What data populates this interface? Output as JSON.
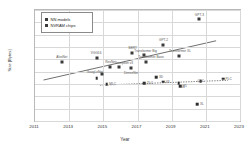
{
  "chart_data": {
    "type": "scatter",
    "title": "",
    "xlabel": "Year",
    "ylabel": "Size [Bytes]",
    "xlim": [
      2011,
      2023
    ],
    "ylim": [
      1000.0,
      1000000000000.0
    ],
    "yscale": "log",
    "grid": true,
    "legend_position": "top-left",
    "xticks": [
      "2011",
      "2013",
      "2015",
      "2017",
      "2019",
      "2021",
      "2023"
    ],
    "yticks": [
      "1.E+12",
      "1.E+11",
      "1.E+10",
      "1.E+09",
      "1.E+08",
      "1.E+07",
      "1.E+06",
      "1.E+05",
      "1.E+04",
      "1.E+03"
    ],
    "series": [
      {
        "name": "NN models",
        "points": [
          {
            "label": "AlexNet",
            "x": 2012.6,
            "y": 62000000.0,
            "lx": -0.05,
            "ly": 1.9
          },
          {
            "label": "VGG16",
            "x": 2014.6,
            "y": 140000000.0,
            "lx": -0.05,
            "ly": 1.9
          },
          {
            "label": "GoogLeNet",
            "x": 2014.9,
            "y": 6800000.0,
            "lx": -0.85,
            "ly": 0.55
          },
          {
            "label": "ResNet",
            "x": 2015.4,
            "y": 26000000.0,
            "lx": 0.05,
            "ly": 1.9
          },
          {
            "label": "Inception v3",
            "x": 2015.9,
            "y": 24000000.0,
            "lx": 0.72,
            "ly": 1.75
          },
          {
            "label": "DenseNet",
            "x": 2016.6,
            "y": 20000000.0,
            "lx": 0.05,
            "ly": -2.0
          },
          {
            "label": "BERT",
            "x": 2016.7,
            "y": 340000000.0,
            "lx": 0.05,
            "ly": 1.9
          },
          {
            "label": "Transformer Big",
            "x": 2017.4,
            "y": 210000000.0,
            "lx": 0.15,
            "ly": 1.9
          },
          {
            "label": "Transformer Base",
            "x": 2017.5,
            "y": 65000000.0,
            "lx": 0.62,
            "ly": 1.75
          },
          {
            "label": "GPT-2",
            "x": 2018.5,
            "y": 1500000000.0,
            "lx": 0.05,
            "ly": 1.9
          },
          {
            "label": "Transformer XL",
            "x": 2019.4,
            "y": 190000000.0,
            "lx": 0.18,
            "ly": 1.9
          },
          {
            "label": "GPT-3",
            "x": 2020.6,
            "y": 175000000000.0,
            "lx": 0.05,
            "ly": 1.9
          }
        ],
        "trendline": {
          "x1": 2011.5,
          "y1": 2100000.0,
          "x2": 2021.6,
          "y2": 3200000000.0,
          "style": "solid"
        }
      },
      {
        "name": "NVRAM chips",
        "points": [
          {
            "label": "",
            "x": 2014.6,
            "y": 2900000.0,
            "lx": 0.0,
            "ly": 0.0
          },
          {
            "label": "MLC",
            "x": 2015.2,
            "y": 950000.0,
            "lx": 0.62,
            "ly": 0.0
          },
          {
            "label": "TLC",
            "x": 2017.4,
            "y": 1100000.0,
            "lx": 0.55,
            "ly": 0.0
          },
          {
            "label": "3D",
            "x": 2018.1,
            "y": 3400000.0,
            "lx": 0.55,
            "ly": 0.0
          },
          {
            "label": "V3",
            "x": 2018.5,
            "y": 1500000.0,
            "lx": 0.55,
            "ly": 0.0
          },
          {
            "label": "V4",
            "x": 2019.4,
            "y": 1200000.0,
            "lx": 0.55,
            "ly": -1.6
          },
          {
            "label": "V5",
            "x": 2019.5,
            "y": 680000.0,
            "lx": 0.55,
            "ly": 0.0
          },
          {
            "label": "QLC",
            "x": 2020.7,
            "y": 1600000.0,
            "lx": 0.0,
            "ly": 0.0
          },
          {
            "label": "PLC",
            "x": 2022.0,
            "y": 2600000.0,
            "lx": 0.55,
            "ly": 0.0
          },
          {
            "label": "XL",
            "x": 2020.5,
            "y": 23000.0,
            "lx": 0.62,
            "ly": 0.0
          }
        ],
        "trendline": {
          "x1": 2014.8,
          "y1": 800000.0,
          "x2": 2022.3,
          "y2": 2000000.0,
          "style": "dotted"
        }
      }
    ]
  },
  "legend": {
    "items": [
      {
        "label": "NN models"
      },
      {
        "label": "NVRAM chips"
      }
    ]
  }
}
